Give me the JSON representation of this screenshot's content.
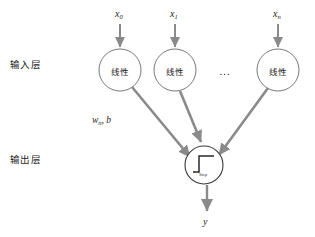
{
  "figure": {
    "type": "neural-network-diagram",
    "background_color": "#ffffff",
    "width": 315,
    "height": 237
  },
  "colors": {
    "arrow": "#8a8a8a",
    "node_stroke": "#7a7a7a",
    "node_fill": "#ffffff",
    "text": "#1c1c1c",
    "step_glyph": "#2a2a2a"
  },
  "layer_labels": {
    "input": "输入层",
    "output": "输出层"
  },
  "inputs": [
    {
      "symbol": "x",
      "subscript": "0"
    },
    {
      "symbol": "x",
      "subscript": "1"
    },
    {
      "symbol": "x",
      "subscript": "n"
    }
  ],
  "input_nodes": [
    {
      "label": "线性",
      "cx": 120,
      "cy": 70,
      "r": 21
    },
    {
      "label": "线性",
      "cx": 175,
      "cy": 70,
      "r": 21
    },
    {
      "label": "线性",
      "cx": 278,
      "cy": 70,
      "r": 21
    }
  ],
  "ellipsis": "...",
  "weight_label": {
    "symbol": "w",
    "subscript": "n",
    "rest": ", b"
  },
  "output_node": {
    "activation_caption": "Step",
    "cx": 204,
    "cy": 165,
    "r": 19
  },
  "output": {
    "symbol": "y"
  }
}
